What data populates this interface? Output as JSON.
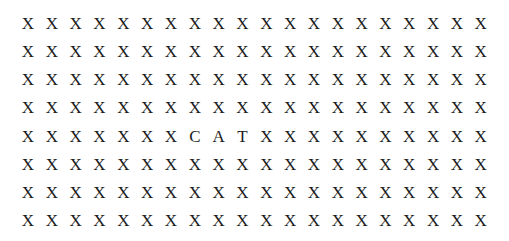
{
  "page": {
    "background_color": "#ffffff",
    "letter_color": "#1b1b1b",
    "rows": 8,
    "columns": 20,
    "filler_letter": "X",
    "hidden_word": "CAT",
    "hidden_word_row": 5,
    "hidden_word_start_column": 8
  },
  "grid": {
    "rows": [
      {
        "index": 1,
        "cells": [
          "X",
          "X",
          "X",
          "X",
          "X",
          "X",
          "X",
          "X",
          "X",
          "X",
          "X",
          "X",
          "X",
          "X",
          "X",
          "X",
          "X",
          "X",
          "X",
          "X"
        ]
      },
      {
        "index": 2,
        "cells": [
          "X",
          "X",
          "X",
          "X",
          "X",
          "X",
          "X",
          "X",
          "X",
          "X",
          "X",
          "X",
          "X",
          "X",
          "X",
          "X",
          "X",
          "X",
          "X",
          "X"
        ]
      },
      {
        "index": 3,
        "cells": [
          "X",
          "X",
          "X",
          "X",
          "X",
          "X",
          "X",
          "X",
          "X",
          "X",
          "X",
          "X",
          "X",
          "X",
          "X",
          "X",
          "X",
          "X",
          "X",
          "X"
        ]
      },
      {
        "index": 4,
        "cells": [
          "X",
          "X",
          "X",
          "X",
          "X",
          "X",
          "X",
          "X",
          "X",
          "X",
          "X",
          "X",
          "X",
          "X",
          "X",
          "X",
          "X",
          "X",
          "X",
          "X"
        ]
      },
      {
        "index": 5,
        "cells": [
          "X",
          "X",
          "X",
          "X",
          "X",
          "X",
          "X",
          "C",
          "A",
          "T",
          "X",
          "X",
          "X",
          "X",
          "X",
          "X",
          "X",
          "X",
          "X",
          "X"
        ]
      },
      {
        "index": 6,
        "cells": [
          "X",
          "X",
          "X",
          "X",
          "X",
          "X",
          "X",
          "X",
          "X",
          "X",
          "X",
          "X",
          "X",
          "X",
          "X",
          "X",
          "X",
          "X",
          "X",
          "X"
        ]
      },
      {
        "index": 7,
        "cells": [
          "X",
          "X",
          "X",
          "X",
          "X",
          "X",
          "X",
          "X",
          "X",
          "X",
          "X",
          "X",
          "X",
          "X",
          "X",
          "X",
          "X",
          "X",
          "X",
          "X"
        ]
      },
      {
        "index": 8,
        "cells": [
          "X",
          "X",
          "X",
          "X",
          "X",
          "X",
          "X",
          "X",
          "X",
          "X",
          "X",
          "X",
          "X",
          "X",
          "X",
          "X",
          "X",
          "X",
          "X",
          "X"
        ]
      }
    ]
  }
}
